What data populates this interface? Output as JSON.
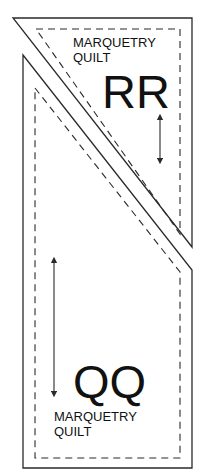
{
  "diagram": {
    "pieces": [
      {
        "id": "RR",
        "label": "RR",
        "caption_line1": "MARQUETRY",
        "caption_line2": "QUILT",
        "grainline": "vertical-double-arrow"
      },
      {
        "id": "QQ",
        "label": "QQ",
        "caption_line1": "MARQUETRY",
        "caption_line2": "QUILT",
        "grainline": "vertical-double-arrow"
      }
    ],
    "colors": {
      "line": "#2a2a2a",
      "background": "#ffffff"
    }
  }
}
